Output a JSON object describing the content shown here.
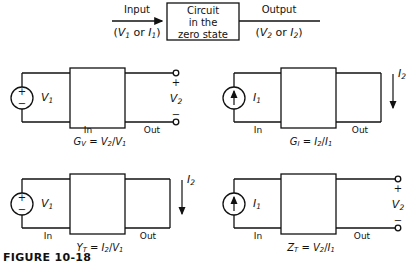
{
  "figure": {
    "caption": "FIGURE  10-18",
    "line_color": "#111111"
  },
  "block_diagram": {
    "input_label": "Input",
    "input_sublabel_open": "(",
    "input_var1": "V",
    "input_var1_sub": "1",
    "input_or": " or ",
    "input_var2": "I",
    "input_var2_sub": "1",
    "input_sublabel_close": ")",
    "box_line1": "Circuit",
    "box_line2": "in the",
    "box_line3": "zero state",
    "output_label": "Output",
    "output_var1": "V",
    "output_var1_sub": "2",
    "output_var2": "I",
    "output_var2_sub": "2"
  },
  "circuits": [
    {
      "id": "voltage-gain",
      "source_type": "voltage-source",
      "source_plus": "+",
      "source_minus": "−",
      "source_label_var": "V",
      "source_label_sub": "1",
      "in_label": "In",
      "out_label": "Out",
      "output_type": "open-terminals",
      "output_var": "V",
      "output_var_sub": "2",
      "terminal_plus": "+",
      "terminal_minus": "−",
      "formula_lhs": "G",
      "formula_lhs_sub": "V",
      "formula_eq": " = ",
      "formula_num": "V",
      "formula_num_sub": "2",
      "formula_slash": "/",
      "formula_den": "V",
      "formula_den_sub": "1"
    },
    {
      "id": "current-gain",
      "source_type": "current-source",
      "source_label_var": "I",
      "source_label_sub": "1",
      "in_label": "In",
      "out_label": "Out",
      "output_type": "short-circuit",
      "output_var": "I",
      "output_var_sub": "2",
      "formula_lhs": "G",
      "formula_lhs_sub": "I",
      "formula_eq": " = ",
      "formula_num": "I",
      "formula_num_sub": "2",
      "formula_slash": "/",
      "formula_den": "I",
      "formula_den_sub": "1"
    },
    {
      "id": "transfer-admittance",
      "source_type": "voltage-source",
      "source_plus": "+",
      "source_minus": "−",
      "source_label_var": "V",
      "source_label_sub": "1",
      "in_label": "In",
      "out_label": "Out",
      "output_type": "short-circuit",
      "output_var": "I",
      "output_var_sub": "2",
      "formula_lhs": "Y",
      "formula_lhs_sub": "T",
      "formula_eq": " = ",
      "formula_num": "I",
      "formula_num_sub": "2",
      "formula_slash": "/",
      "formula_den": "V",
      "formula_den_sub": "1"
    },
    {
      "id": "transfer-impedance",
      "source_type": "current-source",
      "source_label_var": "I",
      "source_label_sub": "1",
      "in_label": "In",
      "out_label": "Out",
      "output_type": "open-terminals",
      "output_var": "V",
      "output_var_sub": "2",
      "terminal_plus": "+",
      "terminal_minus": "−",
      "formula_lhs": "Z",
      "formula_lhs_sub": "T",
      "formula_eq": " = ",
      "formula_num": "V",
      "formula_num_sub": "2",
      "formula_slash": "/",
      "formula_den": "I",
      "formula_den_sub": "1"
    }
  ]
}
